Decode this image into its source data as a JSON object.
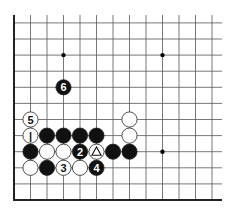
{
  "diagram": {
    "type": "go-board-fragment",
    "columns": 13,
    "rows": 12,
    "edges": [
      "left",
      "bottom"
    ],
    "star_points": [
      [
        3,
        9
      ],
      [
        9,
        9
      ],
      [
        9,
        3
      ]
    ],
    "stones": [
      {
        "col": 3,
        "row": 7,
        "color": "black",
        "label": "6"
      },
      {
        "col": 1,
        "row": 5,
        "color": "white",
        "label": "5"
      },
      {
        "col": 7,
        "row": 5,
        "color": "white",
        "label": ""
      },
      {
        "col": 1,
        "row": 4,
        "color": "white",
        "label": "1"
      },
      {
        "col": 2,
        "row": 4,
        "color": "black",
        "label": ""
      },
      {
        "col": 3,
        "row": 4,
        "color": "black",
        "label": ""
      },
      {
        "col": 4,
        "row": 4,
        "color": "black",
        "label": ""
      },
      {
        "col": 5,
        "row": 4,
        "color": "black",
        "label": ""
      },
      {
        "col": 7,
        "row": 4,
        "color": "white",
        "label": ""
      },
      {
        "col": 1,
        "row": 3,
        "color": "black",
        "label": ""
      },
      {
        "col": 2,
        "row": 3,
        "color": "white",
        "label": ""
      },
      {
        "col": 3,
        "row": 3,
        "color": "white",
        "label": ""
      },
      {
        "col": 4,
        "row": 3,
        "color": "black",
        "label": "2"
      },
      {
        "col": 5,
        "row": 3,
        "color": "white",
        "label": "△"
      },
      {
        "col": 6,
        "row": 3,
        "color": "black",
        "label": ""
      },
      {
        "col": 7,
        "row": 3,
        "color": "black",
        "label": ""
      },
      {
        "col": 1,
        "row": 2,
        "color": "white",
        "label": ""
      },
      {
        "col": 2,
        "row": 2,
        "color": "black",
        "label": ""
      },
      {
        "col": 3,
        "row": 2,
        "color": "white",
        "label": "3"
      },
      {
        "col": 4,
        "row": 2,
        "color": "white",
        "label": ""
      },
      {
        "col": 5,
        "row": 2,
        "color": "black",
        "label": "4"
      }
    ],
    "colors": {
      "black_stone": "#111111",
      "white_stone": "#ffffff",
      "line": "#555555",
      "edge": "#222222"
    }
  }
}
